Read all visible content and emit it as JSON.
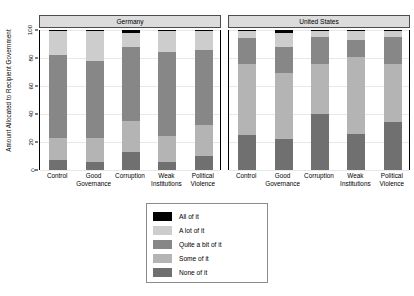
{
  "chart_data": {
    "type": "bar",
    "subtype": "stacked-bar-100-percent",
    "title": "",
    "xlabel": "",
    "ylabel": "Amount Allocated to Recipient Government",
    "ylim": [
      0,
      100
    ],
    "yticks": [
      0,
      20,
      40,
      60,
      80,
      100
    ],
    "grid": true,
    "legend_position": "bottom-center",
    "panels": [
      "Germany",
      "United States"
    ],
    "categories": [
      "Control",
      "Good Governance",
      "Corruption",
      "Weak Institutions",
      "Political Violence"
    ],
    "category_lines": [
      [
        "Control",
        ""
      ],
      [
        "Good",
        "Governance"
      ],
      [
        "Corruption",
        ""
      ],
      [
        "Weak",
        "Institutions"
      ],
      [
        "Political",
        "Violence"
      ]
    ],
    "series": [
      {
        "name": "None of it",
        "color": "#707070"
      },
      {
        "name": "Some of it",
        "color": "#b4b4b4"
      },
      {
        "name": "Quite a bit of it",
        "color": "#878787"
      },
      {
        "name": "A lot of it",
        "color": "#cdcdcd"
      },
      {
        "name": "All of it",
        "color": "#000000"
      }
    ],
    "values": {
      "Germany": {
        "None of it": [
          7,
          6,
          13,
          6,
          10
        ],
        "Some of it": [
          16,
          17,
          22,
          18,
          22
        ],
        "Quite a bit of it": [
          59,
          55,
          53,
          60,
          54
        ],
        "A lot of it": [
          17,
          21,
          10,
          15,
          13
        ],
        "All of it": [
          1,
          1,
          2,
          1,
          1
        ]
      },
      "United States": {
        "None of it": [
          25,
          22,
          40,
          26,
          34
        ],
        "Some of it": [
          51,
          47,
          36,
          55,
          42
        ],
        "Quite a bit of it": [
          18,
          19,
          19,
          12,
          19
        ],
        "A lot of it": [
          5,
          10,
          4,
          6,
          4
        ],
        "All of it": [
          1,
          2,
          1,
          1,
          1
        ]
      }
    },
    "legend_entries": [
      {
        "label": "All of it",
        "color": "#000000"
      },
      {
        "label": "A lot of it",
        "color": "#cdcdcd"
      },
      {
        "label": "Quite a bit of it",
        "color": "#878787"
      },
      {
        "label": "Some of it",
        "color": "#b4b4b4"
      },
      {
        "label": "None of it",
        "color": "#707070"
      }
    ]
  }
}
